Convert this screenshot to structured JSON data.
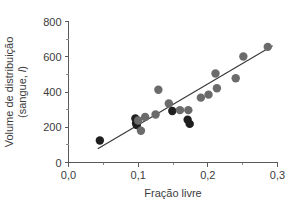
{
  "chart_data": {
    "type": "scatter",
    "title": "",
    "xlabel": "Fração livre",
    "ylabel_line1": "Volume de distribuição",
    "ylabel_line2": "(sangue, ",
    "ylabel_line2_italic": "l",
    "ylabel_line2_end": ")",
    "xlim": [
      0.0,
      0.3
    ],
    "ylim": [
      0,
      800
    ],
    "grid": false,
    "legend": null,
    "x_ticks": [
      0.0,
      0.1,
      0.2,
      0.3
    ],
    "x_tick_labels": [
      "0,0",
      "0,1",
      "0,2",
      "0,3"
    ],
    "x_minor_ticks": [
      0.05,
      0.15,
      0.25
    ],
    "y_ticks": [
      0,
      200,
      400,
      600,
      800
    ],
    "y_tick_labels": [
      "0",
      "200",
      "400",
      "600",
      "800"
    ],
    "y_minor_ticks": [
      100,
      300,
      500,
      700
    ],
    "marker_color_gray": "#6b6b6b",
    "marker_color_dark": "#1f1f1f",
    "line_color": "#3a3a3a",
    "axis_color": "#5a5a5a",
    "text_color": "#3c3c3c",
    "background_color": "#ffffff",
    "marker_radius": 4.2,
    "fit_line": {
      "x_start": 0.042,
      "y_start": 78,
      "x_end": 0.293,
      "y_end": 663
    },
    "points": [
      {
        "x": 0.045,
        "y": 125,
        "color": "dark"
      },
      {
        "x": 0.096,
        "y": 250,
        "color": "dark"
      },
      {
        "x": 0.097,
        "y": 222,
        "color": "dark"
      },
      {
        "x": 0.098,
        "y": 212,
        "color": "dark"
      },
      {
        "x": 0.1,
        "y": 238,
        "color": "gray"
      },
      {
        "x": 0.104,
        "y": 180,
        "color": "gray"
      },
      {
        "x": 0.11,
        "y": 258,
        "color": "gray"
      },
      {
        "x": 0.125,
        "y": 272,
        "color": "gray"
      },
      {
        "x": 0.129,
        "y": 413,
        "color": "gray"
      },
      {
        "x": 0.144,
        "y": 335,
        "color": "gray"
      },
      {
        "x": 0.149,
        "y": 292,
        "color": "dark"
      },
      {
        "x": 0.16,
        "y": 297,
        "color": "gray"
      },
      {
        "x": 0.172,
        "y": 297,
        "color": "gray"
      },
      {
        "x": 0.171,
        "y": 243,
        "color": "dark"
      },
      {
        "x": 0.174,
        "y": 219,
        "color": "dark"
      },
      {
        "x": 0.19,
        "y": 368,
        "color": "gray"
      },
      {
        "x": 0.201,
        "y": 385,
        "color": "gray"
      },
      {
        "x": 0.211,
        "y": 505,
        "color": "gray"
      },
      {
        "x": 0.213,
        "y": 421,
        "color": "gray"
      },
      {
        "x": 0.24,
        "y": 478,
        "color": "gray"
      },
      {
        "x": 0.251,
        "y": 601,
        "color": "gray"
      },
      {
        "x": 0.286,
        "y": 656,
        "color": "gray"
      }
    ]
  }
}
